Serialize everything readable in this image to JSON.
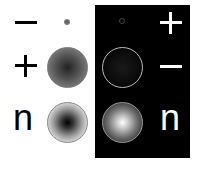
{
  "figure": {
    "left_column": {
      "rows": [
        {
          "label": "−",
          "symbol": "minus"
        },
        {
          "label": "+",
          "symbol": "plus"
        },
        {
          "label": "n",
          "symbol": "n"
        }
      ]
    },
    "right_column": {
      "rows": [
        {
          "label": "+",
          "symbol": "plus"
        },
        {
          "label": "−",
          "symbol": "minus"
        },
        {
          "label": "n",
          "symbol": "n"
        }
      ]
    },
    "colors": {
      "background": "#ffffff",
      "panel": "#000000",
      "text_light_bg": "#000000",
      "text_dark_bg": "#ffffff"
    }
  }
}
